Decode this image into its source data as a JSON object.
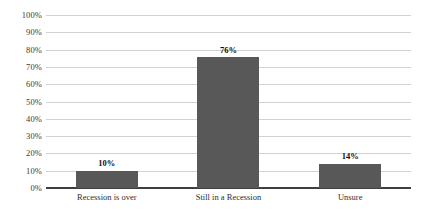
{
  "chart_data": {
    "type": "bar",
    "title": "",
    "subtitle": "",
    "xlabel": "",
    "ylabel": "",
    "categories": [
      "Recession is over",
      "Still in a Recession",
      "Unsure"
    ],
    "values": [
      10,
      76,
      14
    ],
    "value_labels": [
      "10%",
      "76%",
      "14%"
    ],
    "ylim": [
      0,
      100
    ],
    "ytick_values": [
      100,
      90,
      80,
      70,
      60,
      50,
      40,
      30,
      20,
      10,
      0
    ],
    "ytick_labels": [
      "100%",
      "90%",
      "80%",
      "70%",
      "60%",
      "50%",
      "40%",
      "30%",
      "20%",
      "10%",
      "0%"
    ],
    "grid": true,
    "grid_axis": "y",
    "legend": false,
    "legend_position": "none",
    "orientation": "vertical",
    "colors": {
      "bar_fill": "#585858",
      "gridline": "#d2d2d2",
      "baseline": "#3f3f3f",
      "tick_label": "#3a3a3a",
      "category_label": "#2e2e2e",
      "value_label": "#111111",
      "background": "#ffffff"
    }
  }
}
